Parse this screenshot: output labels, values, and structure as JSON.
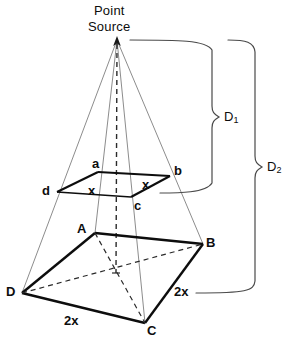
{
  "figure": {
    "title_line1": "Point",
    "title_line2": "Source"
  },
  "labels": {
    "apex_line1": "Point",
    "apex_line2": "Source",
    "near_square": {
      "a": "a",
      "b": "b",
      "c": "c",
      "d": "d",
      "side_left": "x",
      "side_right": "x"
    },
    "far_square": {
      "A": "A",
      "B": "B",
      "C": "C",
      "D": "D",
      "side_right": "2x",
      "side_left": "2x"
    },
    "distances": {
      "d1_base": "D",
      "d1_sub": "1",
      "d2_base": "D",
      "d2_sub": "2"
    }
  },
  "geometry": {
    "apex": [
      117,
      40
    ],
    "near_square_points": {
      "a": [
        98,
        172
      ],
      "b": [
        170,
        176
      ],
      "c": [
        131,
        197
      ],
      "d": [
        57,
        192
      ]
    },
    "far_square_points": {
      "A": [
        95,
        233
      ],
      "B": [
        203,
        244
      ],
      "C": [
        145,
        323
      ],
      "D": [
        22,
        293
      ]
    },
    "center_near": [
      114,
      184
    ],
    "center_far": [
      116,
      273
    ],
    "brace_d1": {
      "top_y": 40,
      "bottom_y": 193,
      "left_x": 130,
      "right_x": 216,
      "tip_y": 117
    },
    "brace_d2": {
      "top_y": 40,
      "bottom_y": 293,
      "left_x": 196,
      "right_x": 259,
      "tip_y": 167
    }
  },
  "colors": {
    "ink": "#0d0d0d",
    "ray": "#6e6e6e",
    "brace": "#4a4a4a",
    "background": "#ffffff"
  }
}
